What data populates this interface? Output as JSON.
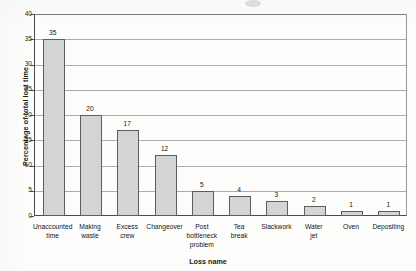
{
  "chart_data": {
    "type": "bar",
    "title": "",
    "xlabel": "Loss name",
    "ylabel": "Percentage of total lost time",
    "ylim": [
      0,
      40
    ],
    "ytick_step": 5,
    "grid": true,
    "legend": false,
    "bar_color": "#d2d5d4",
    "bar_edge_color": "#5d5f5e",
    "axis_color": "#4a4a4a",
    "gridline_color": "#a9acab",
    "yticks": [
      "40",
      "35",
      "30",
      "25",
      "20",
      "15",
      "10",
      "5",
      "0"
    ],
    "categories": [
      "Unaccounted time",
      "Making waste",
      "Excess crew",
      "Changeover",
      "Post bottleneck problem",
      "Tea break",
      "Slackwork",
      "Water jet",
      "Oven",
      "Depositing"
    ],
    "category_lines": [
      [
        "Unaccounted",
        "time"
      ],
      [
        "Making",
        "waste"
      ],
      [
        "Excess",
        "crew"
      ],
      [
        "Changeover"
      ],
      [
        "Post",
        "bottleneck",
        "problem"
      ],
      [
        "Tea",
        "break"
      ],
      [
        "Slackwork"
      ],
      [
        "Water",
        "jet"
      ],
      [
        "Oven"
      ],
      [
        "Depositing"
      ]
    ],
    "values": [
      35,
      20,
      17,
      12,
      5,
      4,
      3,
      2,
      1,
      1
    ],
    "value_labels": [
      "35",
      "20",
      "17",
      "12",
      "5",
      "4",
      "3",
      "2",
      "1",
      "1"
    ]
  }
}
